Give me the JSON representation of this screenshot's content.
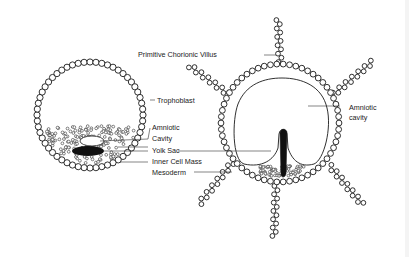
{
  "diagram": {
    "colors": {
      "ink": "#1a1a1a",
      "background": "#ffffff",
      "fill_dark": "#111111"
    },
    "left_figure": {
      "name": "blastocyst",
      "labels": {
        "trophoblast": "Trophoblast",
        "amniotic_cavity_line1": "Amniotic",
        "amniotic_cavity_line2": "Cavity",
        "yolk_sac": "Yolk Sac",
        "inner_cell_mass": "Inner Cell Mass",
        "mesoderm": "Mesoderm"
      }
    },
    "right_figure": {
      "name": "chorionic-vesicle",
      "labels": {
        "primitive_chorionic_villus": "Primitive Chorionic Villus",
        "amniotic_cavity_line1": "Amniotic",
        "amniotic_cavity_line2": "cavity"
      }
    }
  }
}
